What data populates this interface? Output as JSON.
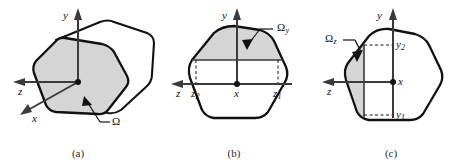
{
  "figure": {
    "type": "technical-line-diagram",
    "background_color": "#ffffff",
    "outline_color": "#111111",
    "shade_color": "#d5d5d5",
    "axis_color": "#3a3a3a",
    "panels": [
      {
        "id": "a",
        "caption": "(a)",
        "description": "Three-dimensional body with shaded planar cross-section",
        "axes": [
          {
            "name": "y",
            "label": "y",
            "direction": "up"
          },
          {
            "name": "z",
            "label": "z",
            "direction": "left"
          },
          {
            "name": "x",
            "label": "x",
            "direction": "down-left-oblique"
          }
        ],
        "annotations": [
          {
            "name": "region-omega",
            "label": "Ω",
            "subscript": ""
          }
        ]
      },
      {
        "id": "b",
        "caption": "(b)",
        "description": "Cross-section with horizontal strip region above chord",
        "axes": [
          {
            "name": "y",
            "label": "y",
            "direction": "up"
          },
          {
            "name": "z",
            "label": "z",
            "direction": "left"
          },
          {
            "name": "x",
            "label": "x",
            "direction": "origin"
          }
        ],
        "annotations": [
          {
            "name": "region-omega-y",
            "label": "Ω",
            "subscript": "y"
          }
        ],
        "tick_labels": [
          {
            "name": "z2",
            "label": "z",
            "subscript": "2"
          },
          {
            "name": "x-origin",
            "label": "x",
            "subscript": ""
          },
          {
            "name": "z1",
            "label": "z",
            "subscript": "1"
          }
        ]
      },
      {
        "id": "c",
        "caption": "(c)",
        "description": "Cross-section with narrow vertical strip region at left edge",
        "axes": [
          {
            "name": "y",
            "label": "y",
            "direction": "up"
          },
          {
            "name": "z",
            "label": "z",
            "direction": "left"
          },
          {
            "name": "x",
            "label": "x",
            "direction": "origin"
          }
        ],
        "annotations": [
          {
            "name": "region-omega-z",
            "label": "Ω",
            "subscript": "z"
          }
        ],
        "tick_labels": [
          {
            "name": "y2",
            "label": "y",
            "subscript": "2"
          },
          {
            "name": "x-origin",
            "label": "x",
            "subscript": ""
          },
          {
            "name": "y1",
            "label": "y",
            "subscript": "1"
          }
        ]
      }
    ]
  }
}
